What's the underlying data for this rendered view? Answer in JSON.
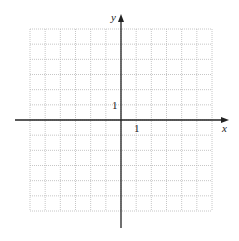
{
  "diagram": {
    "type": "coordinate-grid",
    "x_axis_label": "x",
    "y_axis_label": "y",
    "x_tick_label": "1",
    "y_tick_label": "1",
    "grid": {
      "cols": 12,
      "rows": 12,
      "x_range": [
        -6,
        6
      ],
      "y_range": [
        -6,
        6
      ],
      "style": "dotted"
    },
    "colors": {
      "grid": "#b8b8b8",
      "axis": "#222222"
    }
  }
}
